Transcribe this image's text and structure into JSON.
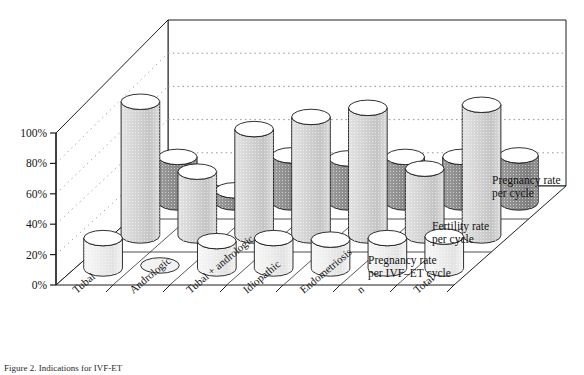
{
  "figure": {
    "caption": "Figure 2. Indications for IVF-ET",
    "background": "#ffffff"
  },
  "axis": {
    "y_ticks": [
      "0%",
      "20%",
      "40%",
      "60%",
      "80%",
      "100%"
    ],
    "y_tick_values": [
      0,
      20,
      40,
      60,
      80,
      100
    ]
  },
  "legend": [
    {
      "line1": "Pregnancy rate",
      "line2": "per IVF–ET cycle",
      "swatch": "#8c8c8c"
    },
    {
      "line1": "Fertility rate",
      "line2": "per cycle",
      "swatch": "#c9c9c9"
    },
    {
      "line1": "Pregnancy rate",
      "line2": "per cycle",
      "swatch": "#ededed"
    }
  ],
  "colors": {
    "series_back": "#8c8c8c",
    "series_mid": "#cfcfcf",
    "series_front": "#efefef",
    "outline": "#1a1a1a",
    "floor": "#ffffff",
    "wall": "#ffffff",
    "gridline": "#9a9a9a"
  },
  "chart_data": {
    "type": "bar",
    "title": "",
    "xlabel": "",
    "ylabel": "",
    "ylim": [
      0,
      100
    ],
    "grid": true,
    "legend_position": "right",
    "projection": "3d-cylinder",
    "categories": [
      "Tubal",
      "Andrologic",
      "Tubal + andrologic",
      "Idiopathic",
      "Endometriosis",
      "n",
      "Total"
    ],
    "series": [
      {
        "name": "Pregnancy rate per cycle",
        "row": "front",
        "color": "#efefef",
        "values": [
          20,
          2,
          18,
          20,
          19,
          20,
          21
        ]
      },
      {
        "name": "Fertility rate per cycle",
        "row": "middle",
        "color": "#cfcfcf",
        "values": [
          88,
          42,
          70,
          78,
          84,
          44,
          86
        ]
      },
      {
        "name": "Pregnancy rate per IVF-ET cycle",
        "row": "back",
        "color": "#8c8c8c",
        "values": [
          30,
          8,
          31,
          29,
          30,
          30,
          31
        ]
      }
    ]
  }
}
